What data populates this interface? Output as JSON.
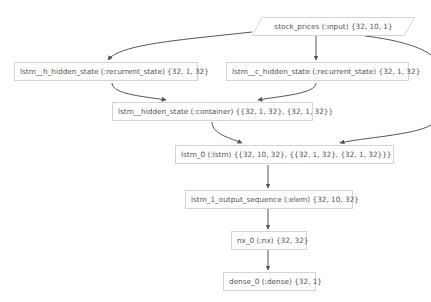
{
  "diagram": {
    "nodes": [
      {
        "id": "stock_prices",
        "label": "stock_prices (:input) {32, 10, 1}",
        "shape": "parallelogram"
      },
      {
        "id": "lstm__h_hidden_state",
        "label": "lstm__h_hidden_state (:recurrent_state) {32, 1, 32}",
        "shape": "rect"
      },
      {
        "id": "lstm__c_hidden_state",
        "label": "lstm__c_hidden_state (:recurrent_state) {32, 1, 32}",
        "shape": "rect"
      },
      {
        "id": "lstm__hidden_state",
        "label": "lstm__hidden_state (:container) {{32, 1, 32}, {32, 1, 32}}",
        "shape": "rect"
      },
      {
        "id": "lstm_0",
        "label": "lstm_0 (:lstm) {{32, 10, 32}, {{32, 1, 32}, {32, 1, 32}}}",
        "shape": "rect"
      },
      {
        "id": "lstm_1_output_sequence",
        "label": "lstm_1_output_sequence (:elem) {32, 10, 32}",
        "shape": "rect"
      },
      {
        "id": "nx_0",
        "label": "nx_0 (:nx) {32, 32}",
        "shape": "rect"
      },
      {
        "id": "dense_0",
        "label": "dense_0 (:dense) {32, 1}",
        "shape": "rect"
      }
    ],
    "edges": [
      {
        "from": "stock_prices",
        "to": "lstm__h_hidden_state"
      },
      {
        "from": "stock_prices",
        "to": "lstm__c_hidden_state"
      },
      {
        "from": "stock_prices",
        "to": "lstm_0"
      },
      {
        "from": "lstm__h_hidden_state",
        "to": "lstm__hidden_state"
      },
      {
        "from": "lstm__c_hidden_state",
        "to": "lstm__hidden_state"
      },
      {
        "from": "lstm__hidden_state",
        "to": "lstm_0"
      },
      {
        "from": "lstm_0",
        "to": "lstm_1_output_sequence"
      },
      {
        "from": "lstm_1_output_sequence",
        "to": "nx_0"
      },
      {
        "from": "nx_0",
        "to": "dense_0"
      }
    ],
    "colors": {
      "edge": "#555555",
      "node_border": "#d4d4d4",
      "text": "#555555",
      "background": "#ffffff"
    }
  }
}
